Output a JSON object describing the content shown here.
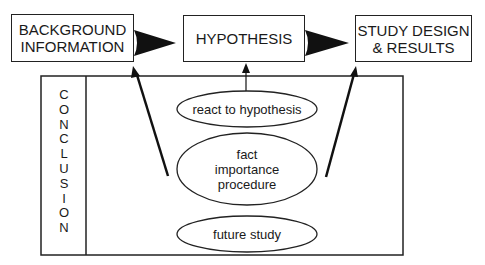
{
  "diagram": {
    "boxes": {
      "background": "BACKGROUND\nINFORMATION",
      "hypothesis": "HYPOTHESIS",
      "study": "STUDY DESIGN\n& RESULTS"
    },
    "conclusion": {
      "label": "CONCLUSION",
      "letters": [
        "C",
        "O",
        "N",
        "C",
        "L",
        "U",
        "S",
        "I",
        "O",
        "N"
      ]
    },
    "ellipses": {
      "react": "react to hypothesis",
      "fact": "fact\nimportance\nprocedure",
      "future": "future study"
    },
    "colors": {
      "stroke": "#222222",
      "background": "#ffffff"
    }
  }
}
